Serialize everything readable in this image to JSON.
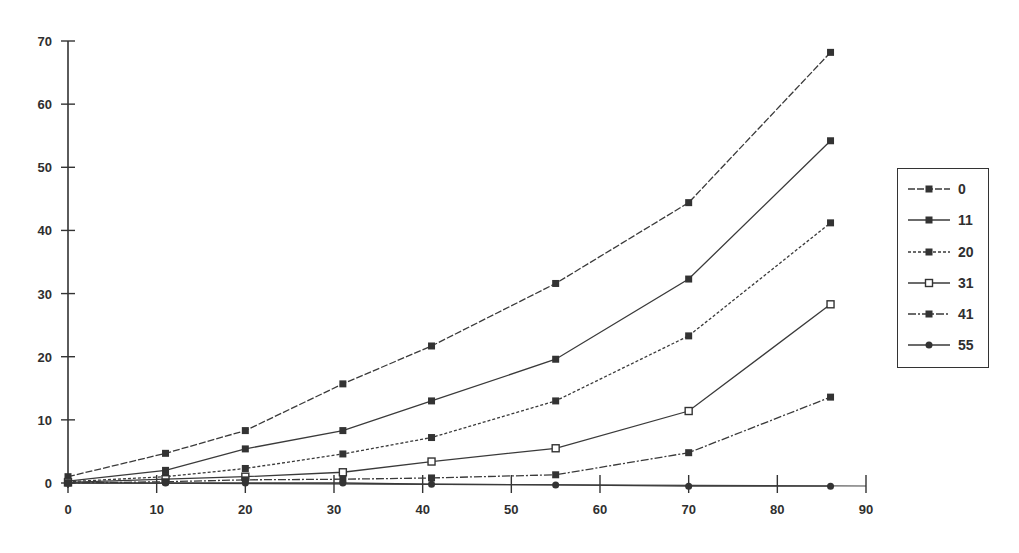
{
  "chart_data": {
    "type": "line",
    "title": "",
    "xlabel": "",
    "ylabel": "",
    "xlim": [
      0,
      90
    ],
    "ylim": [
      0,
      70
    ],
    "x_ticks": [
      0,
      10,
      20,
      30,
      40,
      50,
      60,
      70,
      80,
      90
    ],
    "y_ticks": [
      0,
      10,
      20,
      30,
      40,
      50,
      60,
      70
    ],
    "grid": false,
    "legend_position": "right",
    "x": [
      0,
      11,
      20,
      31,
      41,
      55,
      70,
      86
    ],
    "series": [
      {
        "name": "0",
        "marker": "filled-square",
        "line": "dashed",
        "values": [
          1.0,
          4.7,
          8.3,
          15.7,
          21.7,
          31.6,
          44.4,
          68.2
        ]
      },
      {
        "name": "11",
        "marker": "filled-square",
        "line": "solid",
        "values": [
          0.3,
          2.0,
          5.4,
          8.3,
          13.0,
          19.6,
          32.3,
          54.2
        ]
      },
      {
        "name": "20",
        "marker": "filled-square",
        "line": "dotted",
        "values": [
          0.2,
          1.0,
          2.3,
          4.6,
          7.2,
          13.0,
          23.3,
          41.2
        ]
      },
      {
        "name": "31",
        "marker": "open-square",
        "line": "solid",
        "values": [
          0.1,
          0.6,
          1.0,
          1.7,
          3.4,
          5.5,
          11.4,
          28.3
        ]
      },
      {
        "name": "41",
        "marker": "filled-square",
        "line": "dashdot",
        "values": [
          0.0,
          0.2,
          0.5,
          0.6,
          0.8,
          1.3,
          4.8,
          13.6
        ]
      },
      {
        "name": "55",
        "marker": "filled-circle",
        "line": "solid",
        "values": [
          0.0,
          0.0,
          0.0,
          0.0,
          -0.2,
          -0.3,
          -0.5,
          -0.5
        ]
      }
    ]
  },
  "legend": {
    "items": [
      {
        "label": "0"
      },
      {
        "label": "11"
      },
      {
        "label": "20"
      },
      {
        "label": "31"
      },
      {
        "label": "41"
      },
      {
        "label": "55"
      }
    ]
  },
  "axes": {
    "y_tick_labels": [
      "0",
      "10",
      "20",
      "30",
      "40",
      "50",
      "60",
      "70"
    ],
    "x_tick_labels": [
      "0",
      "10",
      "20",
      "30",
      "40",
      "50",
      "60",
      "70",
      "80",
      "90"
    ]
  },
  "colors": {
    "line": "#3a3a3a",
    "marker": "#333333",
    "background": "#ffffff"
  }
}
